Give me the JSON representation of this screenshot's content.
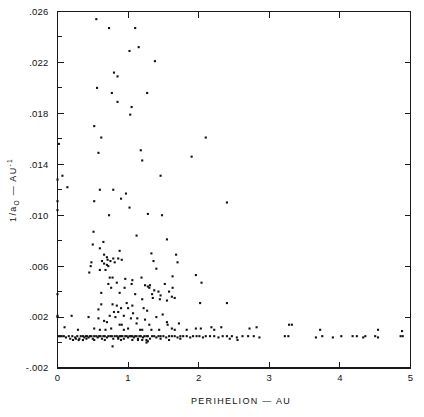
{
  "chart_data": {
    "type": "scatter",
    "title": "",
    "xlabel": "PERIHELION — AU",
    "ylabel_parts": {
      "pre": "1/a",
      "sub": "O",
      "mid": " — AU",
      "sup": "-1"
    },
    "ylabel": "1/aO — AU-1",
    "xlim": [
      0,
      5
    ],
    "ylim": [
      -0.002,
      0.026
    ],
    "grid": false,
    "legend": null,
    "x_major_ticks": [
      0,
      1,
      2,
      3,
      4,
      5
    ],
    "x_major_tick_labels": [
      "0",
      "1",
      "2",
      "3",
      "4",
      "5"
    ],
    "x_minor_ticks": [],
    "y_major_ticks": [
      -0.002,
      0.002,
      0.006,
      0.01,
      0.014,
      0.018,
      0.022,
      0.026
    ],
    "y_major_tick_labels": [
      "-.002",
      ".002",
      ".006",
      ".010",
      ".014",
      ".018",
      ".022",
      ".026"
    ],
    "y_minor_ticks": [
      0.0,
      0.004,
      0.008,
      0.012,
      0.016,
      0.02,
      0.024
    ],
    "marker": "square",
    "marker_size_px": 2.1,
    "marker_color": "#111111",
    "point_count": 268,
    "points": [
      [
        0.02,
        0.0156
      ],
      [
        0.0,
        0.0128
      ],
      [
        0.07,
        0.0131
      ],
      [
        0.0,
        0.0111
      ],
      [
        0.0,
        0.0104
      ],
      [
        0.14,
        0.0122
      ],
      [
        0.52,
        0.017
      ],
      [
        0.56,
        0.02
      ],
      [
        0.55,
        0.0254
      ],
      [
        0.73,
        0.0247
      ],
      [
        1.1,
        0.0247
      ],
      [
        1.02,
        0.0229
      ],
      [
        1.15,
        0.0232
      ],
      [
        1.38,
        0.0221
      ],
      [
        0.8,
        0.0212
      ],
      [
        0.85,
        0.0209
      ],
      [
        0.77,
        0.0196
      ],
      [
        1.27,
        0.0196
      ],
      [
        0.85,
        0.0189
      ],
      [
        1.05,
        0.0185
      ],
      [
        1.03,
        0.0179
      ],
      [
        0.62,
        0.0161
      ],
      [
        2.1,
        0.0161
      ],
      [
        0.58,
        0.0149
      ],
      [
        1.18,
        0.0151
      ],
      [
        1.9,
        0.0146
      ],
      [
        1.2,
        0.0143
      ],
      [
        1.46,
        0.0131
      ],
      [
        0.6,
        0.012
      ],
      [
        0.79,
        0.012
      ],
      [
        0.97,
        0.0117
      ],
      [
        0.52,
        0.0111
      ],
      [
        0.9,
        0.0113
      ],
      [
        1.02,
        0.0106
      ],
      [
        2.4,
        0.011
      ],
      [
        0.73,
        0.01
      ],
      [
        1.28,
        0.0101
      ],
      [
        1.48,
        0.01
      ],
      [
        0.51,
        0.0087
      ],
      [
        1.12,
        0.0084
      ],
      [
        1.55,
        0.0081
      ],
      [
        0.5,
        0.0077
      ],
      [
        0.65,
        0.0079
      ],
      [
        0.6,
        0.0074
      ],
      [
        0.66,
        0.0069
      ],
      [
        0.88,
        0.0072
      ],
      [
        0.7,
        0.0067
      ],
      [
        1.33,
        0.007
      ],
      [
        0.71,
        0.0065
      ],
      [
        0.91,
        0.0065
      ],
      [
        0.48,
        0.0063
      ],
      [
        1.36,
        0.0064
      ],
      [
        0.47,
        0.006
      ],
      [
        0.7,
        0.0061
      ],
      [
        0.6,
        0.0057
      ],
      [
        1.4,
        0.0058
      ],
      [
        0.45,
        0.0055
      ],
      [
        1.63,
        0.0052
      ],
      [
        0.74,
        0.0051
      ],
      [
        0.78,
        0.0051
      ],
      [
        1.96,
        0.0053
      ],
      [
        0.96,
        0.005
      ],
      [
        1.06,
        0.0049
      ],
      [
        1.19,
        0.0051
      ],
      [
        2.04,
        0.0047
      ],
      [
        0.72,
        0.0046
      ],
      [
        1.24,
        0.0045
      ],
      [
        1.28,
        0.0044
      ],
      [
        1.31,
        0.0045
      ],
      [
        1.3,
        0.0043
      ],
      [
        1.52,
        0.0046
      ],
      [
        0.62,
        0.0039
      ],
      [
        0.0,
        0.0038
      ],
      [
        0.88,
        0.0039
      ],
      [
        1.1,
        0.0038
      ],
      [
        1.58,
        0.004
      ],
      [
        1.62,
        0.0036
      ],
      [
        1.35,
        0.0035
      ],
      [
        1.45,
        0.0034
      ],
      [
        2.02,
        0.0031
      ],
      [
        2.4,
        0.0031
      ],
      [
        0.62,
        0.003
      ],
      [
        0.78,
        0.003
      ],
      [
        0.84,
        0.0029
      ],
      [
        0.98,
        0.0031
      ],
      [
        1.06,
        0.0029
      ],
      [
        0.9,
        0.0027
      ],
      [
        1.0,
        0.0027
      ],
      [
        0.58,
        0.0026
      ],
      [
        1.22,
        0.0027
      ],
      [
        1.27,
        0.0025
      ],
      [
        0.8,
        0.0024
      ],
      [
        0.86,
        0.0024
      ],
      [
        1.07,
        0.0023
      ],
      [
        0.0,
        0.0021
      ],
      [
        0.0,
        0.002
      ],
      [
        0.2,
        0.0021
      ],
      [
        0.44,
        0.002
      ],
      [
        0.58,
        0.0019
      ],
      [
        0.74,
        0.0021
      ],
      [
        0.82,
        0.002
      ],
      [
        0.94,
        0.0021
      ],
      [
        1.04,
        0.0019
      ],
      [
        1.13,
        0.0019
      ],
      [
        1.4,
        0.002
      ],
      [
        1.24,
        0.0018
      ],
      [
        0.66,
        0.0017
      ],
      [
        0.7,
        0.0016
      ],
      [
        0.88,
        0.0014
      ],
      [
        0.91,
        0.0014
      ],
      [
        1.12,
        0.0015
      ],
      [
        1.3,
        0.0014
      ],
      [
        1.56,
        0.0014
      ],
      [
        1.72,
        0.0015
      ],
      [
        3.28,
        0.0014
      ],
      [
        3.32,
        0.0014
      ],
      [
        0.1,
        0.0012
      ],
      [
        0.29,
        0.001
      ],
      [
        0.52,
        0.0011
      ],
      [
        0.6,
        0.001
      ],
      [
        0.68,
        0.001
      ],
      [
        0.76,
        0.0011
      ],
      [
        0.94,
        0.001
      ],
      [
        1.0,
        0.0011
      ],
      [
        1.17,
        0.001
      ],
      [
        1.2,
        0.001
      ],
      [
        1.33,
        0.001
      ],
      [
        1.44,
        0.001
      ],
      [
        1.62,
        0.0011
      ],
      [
        1.66,
        0.001
      ],
      [
        1.83,
        0.001
      ],
      [
        1.96,
        0.0011
      ],
      [
        2.03,
        0.0011
      ],
      [
        2.22,
        0.001
      ],
      [
        3.72,
        0.001
      ],
      [
        4.54,
        0.001
      ],
      [
        4.88,
        0.0009
      ],
      [
        0.02,
        0.0005
      ],
      [
        0.04,
        0.0005
      ],
      [
        0.06,
        0.0005
      ],
      [
        0.09,
        0.0005
      ],
      [
        0.12,
        0.0004
      ],
      [
        0.16,
        0.0005
      ],
      [
        0.21,
        0.0005
      ],
      [
        0.25,
        0.0004
      ],
      [
        0.28,
        0.0005
      ],
      [
        0.31,
        0.0003
      ],
      [
        0.33,
        0.0005
      ],
      [
        0.36,
        0.0005
      ],
      [
        0.38,
        0.0004
      ],
      [
        0.4,
        0.0005
      ],
      [
        0.42,
        0.0005
      ],
      [
        0.44,
        0.0004
      ],
      [
        0.46,
        0.0005
      ],
      [
        0.48,
        0.0005
      ],
      [
        0.5,
        0.0003
      ],
      [
        0.52,
        0.0005
      ],
      [
        0.55,
        0.0005
      ],
      [
        0.57,
        0.0004
      ],
      [
        0.59,
        0.0005
      ],
      [
        0.61,
        0.0005
      ],
      [
        0.63,
        0.0003
      ],
      [
        0.65,
        0.0005
      ],
      [
        0.67,
        0.0005
      ],
      [
        0.7,
        0.0004
      ],
      [
        0.72,
        0.0005
      ],
      [
        0.75,
        0.0005
      ],
      [
        0.77,
        0.0005
      ],
      [
        0.79,
        0.0003
      ],
      [
        0.81,
        0.0005
      ],
      [
        0.84,
        0.0005
      ],
      [
        0.86,
        0.0004
      ],
      [
        0.88,
        0.0005
      ],
      [
        0.9,
        0.0005
      ],
      [
        0.92,
        0.0005
      ],
      [
        0.94,
        0.0003
      ],
      [
        0.96,
        0.0005
      ],
      [
        0.98,
        0.0005
      ],
      [
        1.0,
        0.0004
      ],
      [
        1.02,
        0.0005
      ],
      [
        1.04,
        0.0005
      ],
      [
        1.06,
        0.0005
      ],
      [
        1.08,
        0.0004
      ],
      [
        1.1,
        0.0005
      ],
      [
        1.12,
        0.0005
      ],
      [
        1.14,
        0.0003
      ],
      [
        1.16,
        0.0005
      ],
      [
        1.18,
        0.0005
      ],
      [
        1.21,
        0.0004
      ],
      [
        1.23,
        0.0005
      ],
      [
        1.26,
        0.0005
      ],
      [
        1.28,
        0.0005
      ],
      [
        1.31,
        0.0003
      ],
      [
        1.34,
        0.0005
      ],
      [
        1.37,
        0.0005
      ],
      [
        1.4,
        0.0004
      ],
      [
        1.43,
        0.0005
      ],
      [
        1.46,
        0.0005
      ],
      [
        1.5,
        0.0005
      ],
      [
        1.54,
        0.0004
      ],
      [
        1.58,
        0.0005
      ],
      [
        1.62,
        0.0005
      ],
      [
        1.66,
        0.0005
      ],
      [
        1.7,
        0.0004
      ],
      [
        1.74,
        0.0005
      ],
      [
        1.78,
        0.0005
      ],
      [
        1.83,
        0.0005
      ],
      [
        1.88,
        0.0004
      ],
      [
        1.92,
        0.0005
      ],
      [
        1.97,
        0.0005
      ],
      [
        2.01,
        0.0005
      ],
      [
        2.06,
        0.0004
      ],
      [
        2.1,
        0.0005
      ],
      [
        2.16,
        0.0005
      ],
      [
        2.22,
        0.0005
      ],
      [
        2.28,
        0.0004
      ],
      [
        2.34,
        0.0005
      ],
      [
        2.4,
        0.0005
      ],
      [
        2.47,
        0.0005
      ],
      [
        2.54,
        0.0004
      ],
      [
        2.62,
        0.0005
      ],
      [
        2.7,
        0.0005
      ],
      [
        2.78,
        0.0005
      ],
      [
        2.86,
        0.0004
      ],
      [
        3.22,
        0.0005
      ],
      [
        3.27,
        0.0005
      ],
      [
        3.66,
        0.0004
      ],
      [
        3.75,
        0.0005
      ],
      [
        3.9,
        0.0004
      ],
      [
        4.02,
        0.0005
      ],
      [
        4.18,
        0.0005
      ],
      [
        4.24,
        0.0005
      ],
      [
        4.33,
        0.0004
      ],
      [
        4.36,
        0.0005
      ],
      [
        4.5,
        0.0005
      ],
      [
        4.54,
        0.0004
      ],
      [
        4.86,
        0.0005
      ],
      [
        4.89,
        0.0005
      ],
      [
        0.3,
        0.0002
      ],
      [
        0.52,
        0.0002
      ],
      [
        0.9,
        0.0002
      ],
      [
        1.14,
        0.0002
      ],
      [
        1.2,
        0.0002
      ],
      [
        1.26,
        0.0002
      ],
      [
        0.78,
        -0.0003
      ],
      [
        1.26,
        0.0
      ],
      [
        1.28,
        0.0001
      ],
      [
        0.36,
        0.0002
      ],
      [
        0.41,
        0.0003
      ],
      [
        0.67,
        0.0002
      ],
      [
        0.86,
        0.0003
      ],
      [
        1.06,
        0.0002
      ],
      [
        1.46,
        0.0003
      ],
      [
        1.58,
        0.0002
      ],
      [
        1.74,
        0.0003
      ],
      [
        2.44,
        0.0003
      ],
      [
        2.55,
        0.0002
      ],
      [
        0.18,
        0.0003
      ],
      [
        0.22,
        0.0002
      ],
      [
        0.26,
        0.0003
      ],
      [
        1.68,
        0.0069
      ],
      [
        1.7,
        0.0063
      ],
      [
        1.63,
        0.0043
      ],
      [
        1.66,
        0.0035
      ],
      [
        1.55,
        0.0033
      ],
      [
        1.43,
        0.004
      ],
      [
        1.37,
        0.0041
      ],
      [
        1.34,
        0.0038
      ],
      [
        1.46,
        0.0037
      ],
      [
        1.2,
        0.0034
      ],
      [
        1.05,
        0.0046
      ],
      [
        0.95,
        0.0043
      ],
      [
        0.84,
        0.0047
      ],
      [
        0.76,
        0.0043
      ],
      [
        0.68,
        0.0057
      ],
      [
        0.63,
        0.0064
      ],
      [
        0.66,
        0.0062
      ],
      [
        0.72,
        0.006
      ],
      [
        0.75,
        0.0064
      ],
      [
        0.79,
        0.0066
      ],
      [
        0.81,
        0.0063
      ],
      [
        0.86,
        0.0066
      ],
      [
        1.49,
        0.0022
      ],
      [
        1.55,
        0.0016
      ],
      [
        2.18,
        0.0012
      ],
      [
        2.32,
        0.0012
      ],
      [
        2.72,
        0.0011
      ],
      [
        2.82,
        0.0012
      ]
    ]
  },
  "figure": {
    "background_color": "#ffffff",
    "axis_color": "#1a1a1a",
    "marker_color": "#111111"
  }
}
